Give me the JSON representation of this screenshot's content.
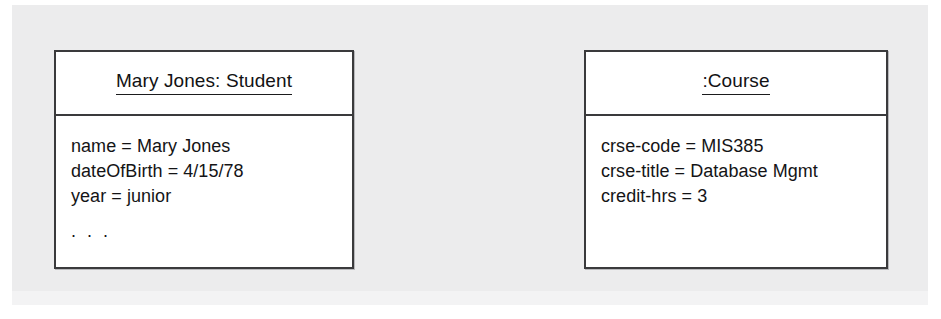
{
  "diagram": {
    "type": "uml-object-diagram",
    "background_color": "#ececed",
    "box_border_color": "#3a3a3c",
    "box_fill_color": "#ffffff",
    "text_color": "#141416",
    "objects": [
      {
        "id": "student",
        "title": "Mary Jones: Student",
        "title_underlined": true,
        "instance_name": "Mary Jones",
        "class_name": "Student",
        "attributes": [
          "name = Mary Jones",
          "dateOfBirth = 4/15/78",
          "year = junior"
        ],
        "continuation": ". . ."
      },
      {
        "id": "course",
        "title": ":Course",
        "title_underlined": true,
        "instance_name": "",
        "class_name": "Course",
        "attributes": [
          "crse-code = MIS385",
          "crse-title = Database Mgmt",
          "credit-hrs = 3"
        ],
        "continuation": ""
      }
    ]
  }
}
